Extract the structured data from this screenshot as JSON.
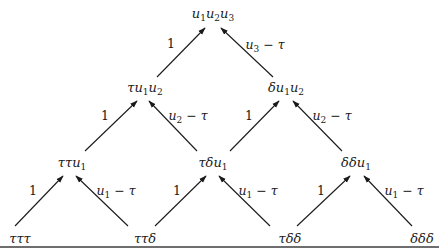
{
  "diagram": {
    "type": "binary-lattice",
    "nodes": {
      "top": {
        "label": "u1u2u3",
        "parts": [
          "u",
          "1",
          "u",
          "2",
          "u",
          "3"
        ]
      },
      "l2_left": {
        "label": "τu1u2",
        "parts": [
          "τu",
          "1",
          "u",
          "2"
        ]
      },
      "l2_right": {
        "label": "δu1u2",
        "parts": [
          "δu",
          "1",
          "u",
          "2"
        ]
      },
      "l3_left": {
        "label": "ττu1",
        "parts": [
          "ττu",
          "1"
        ]
      },
      "l3_mid": {
        "label": "τδu1",
        "parts": [
          "τδu",
          "1"
        ]
      },
      "l3_right": {
        "label": "δδu1",
        "parts": [
          "δδu",
          "1"
        ]
      },
      "b1": {
        "label": "τττ"
      },
      "b2": {
        "label": "ττδ"
      },
      "b3": {
        "label": "τδδ"
      },
      "b4": {
        "label": "δδδ"
      }
    },
    "edges": [
      {
        "from": "l2_left",
        "to": "top",
        "label": "1"
      },
      {
        "from": "l2_right",
        "to": "top",
        "label": "u3 − τ",
        "parts": [
          "u",
          "3",
          " − τ"
        ]
      },
      {
        "from": "l3_left",
        "to": "l2_left",
        "label": "1"
      },
      {
        "from": "l3_mid",
        "to": "l2_left",
        "label": "u2 − τ",
        "parts": [
          "u",
          "2",
          " − τ"
        ]
      },
      {
        "from": "l3_mid",
        "to": "l2_right",
        "label": "1"
      },
      {
        "from": "l3_right",
        "to": "l2_right",
        "label": "u2 − τ",
        "parts": [
          "u",
          "2",
          " − τ"
        ]
      },
      {
        "from": "b1",
        "to": "l3_left",
        "label": "1"
      },
      {
        "from": "b2",
        "to": "l3_left",
        "label": "u1 − τ",
        "parts": [
          "u",
          "1",
          " − τ"
        ]
      },
      {
        "from": "b2",
        "to": "l3_mid",
        "label": "1"
      },
      {
        "from": "b3",
        "to": "l3_mid",
        "label": "u1 − τ",
        "parts": [
          "u",
          "1",
          " − τ"
        ]
      },
      {
        "from": "b3",
        "to": "l3_right",
        "label": "1"
      },
      {
        "from": "b4",
        "to": "l3_right",
        "label": "u1 − τ",
        "parts": [
          "u",
          "1",
          " − τ"
        ]
      }
    ],
    "colors": {
      "stroke": "#1a1a1a",
      "rule": "#6e6e6e",
      "background": "#ffffff"
    }
  }
}
